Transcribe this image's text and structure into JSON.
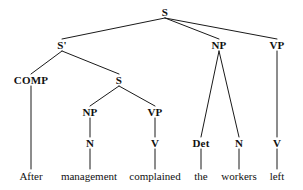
{
  "figure": {
    "kind": "syntax-tree",
    "sentence": "After management complained the workers left",
    "background_color": "#ffffff",
    "line_color": "#1a1a1a",
    "text_color": "#111111"
  },
  "nodes": {
    "root_s": {
      "label": "S",
      "x": 165,
      "y": 12
    },
    "s_bar": {
      "label": "S'",
      "x": 62,
      "y": 45
    },
    "np_subject": {
      "label": "NP",
      "x": 219,
      "y": 45
    },
    "vp_main": {
      "label": "VP",
      "x": 277,
      "y": 45
    },
    "comp": {
      "label": "COMP",
      "x": 31,
      "y": 80
    },
    "s_embedded": {
      "label": "S",
      "x": 119,
      "y": 80
    },
    "np_embedded": {
      "label": "NP",
      "x": 90,
      "y": 112
    },
    "vp_embedded": {
      "label": "VP",
      "x": 155,
      "y": 112
    },
    "n_embedded": {
      "label": "N",
      "x": 90,
      "y": 143
    },
    "v_embedded": {
      "label": "V",
      "x": 155,
      "y": 143
    },
    "det_subject": {
      "label": "Det",
      "x": 201,
      "y": 143
    },
    "n_subject": {
      "label": "N",
      "x": 239,
      "y": 143
    },
    "v_main": {
      "label": "V",
      "x": 277,
      "y": 143
    }
  },
  "words": {
    "after": {
      "label": "After",
      "x": 31,
      "y": 176
    },
    "management": {
      "label": "management",
      "x": 89,
      "y": 176
    },
    "complained": {
      "label": "complained",
      "x": 155,
      "y": 176
    },
    "the": {
      "label": "the",
      "x": 201,
      "y": 176
    },
    "workers": {
      "label": "workers",
      "x": 239,
      "y": 176
    },
    "left": {
      "label": "left",
      "x": 277,
      "y": 176
    }
  },
  "edges": [
    {
      "name": "root-s-to-s-bar",
      "x1": 165,
      "y1": 18,
      "x2": 62,
      "y2": 39
    },
    {
      "name": "root-s-to-np",
      "x1": 165,
      "y1": 18,
      "x2": 219,
      "y2": 39
    },
    {
      "name": "root-s-to-vp",
      "x1": 165,
      "y1": 18,
      "x2": 277,
      "y2": 39
    },
    {
      "name": "s-bar-to-comp",
      "x1": 62,
      "y1": 51,
      "x2": 31,
      "y2": 74
    },
    {
      "name": "s-bar-to-s-embedded",
      "x1": 62,
      "y1": 51,
      "x2": 119,
      "y2": 74
    },
    {
      "name": "comp-to-after",
      "x1": 31,
      "y1": 86,
      "x2": 31,
      "y2": 169
    },
    {
      "name": "s-embedded-to-np",
      "x1": 119,
      "y1": 86,
      "x2": 90,
      "y2": 106
    },
    {
      "name": "s-embedded-to-vp",
      "x1": 119,
      "y1": 86,
      "x2": 155,
      "y2": 106
    },
    {
      "name": "np-embedded-to-n",
      "x1": 90,
      "y1": 118,
      "x2": 90,
      "y2": 137
    },
    {
      "name": "vp-embedded-to-v",
      "x1": 155,
      "y1": 118,
      "x2": 155,
      "y2": 137
    },
    {
      "name": "n-embedded-to-management",
      "x1": 90,
      "y1": 149,
      "x2": 90,
      "y2": 169
    },
    {
      "name": "v-embedded-to-complained",
      "x1": 155,
      "y1": 149,
      "x2": 155,
      "y2": 169
    },
    {
      "name": "np-subject-to-det",
      "x1": 219,
      "y1": 51,
      "x2": 201,
      "y2": 137
    },
    {
      "name": "np-subject-to-n",
      "x1": 219,
      "y1": 51,
      "x2": 239,
      "y2": 137
    },
    {
      "name": "det-to-the",
      "x1": 201,
      "y1": 149,
      "x2": 201,
      "y2": 169
    },
    {
      "name": "n-subject-to-workers",
      "x1": 239,
      "y1": 149,
      "x2": 239,
      "y2": 169
    },
    {
      "name": "vp-main-to-v",
      "x1": 277,
      "y1": 51,
      "x2": 277,
      "y2": 137
    },
    {
      "name": "v-main-to-left",
      "x1": 277,
      "y1": 149,
      "x2": 277,
      "y2": 169
    }
  ]
}
